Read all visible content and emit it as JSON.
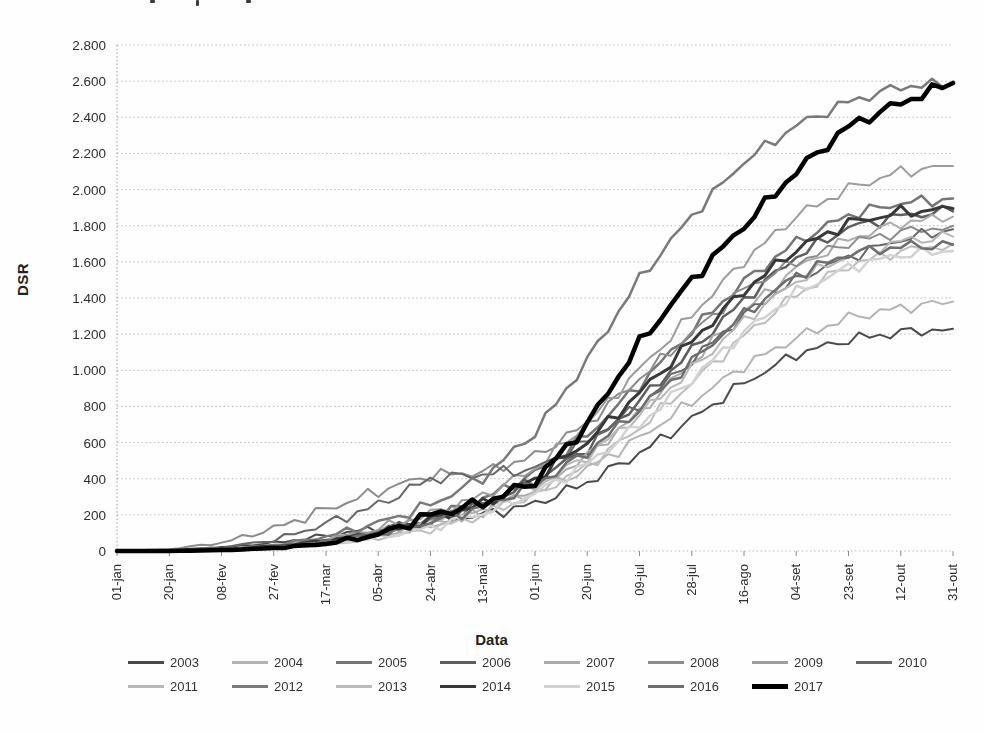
{
  "page": {
    "note": "scanned grayscale line chart, cropped text fragments at very top edge"
  },
  "chart_data": {
    "type": "line",
    "title": "",
    "xlabel": "Data",
    "ylabel": "DSR",
    "x": [
      "01-jan",
      "20-jan",
      "08-fev",
      "27-fev",
      "17-mar",
      "05-abr",
      "24-abr",
      "13-mai",
      "01-jun",
      "20-jun",
      "09-jul",
      "28-jul",
      "16-ago",
      "04-set",
      "23-set",
      "12-out",
      "31-out"
    ],
    "ylim": [
      0,
      2800
    ],
    "y_ticks": [
      0,
      200,
      400,
      600,
      800,
      1000,
      1200,
      1400,
      1600,
      1800,
      2000,
      2200,
      2400,
      2600,
      2800
    ],
    "y_tick_labels": [
      "0",
      "200",
      "400",
      "600",
      "800",
      "1.000",
      "1.200",
      "1.400",
      "1.600",
      "1.800",
      "2.000",
      "2.200",
      "2.400",
      "2.600",
      "2.800"
    ],
    "grid": "horizontal-dotted",
    "legend_position": "bottom-two-rows",
    "series": [
      {
        "name": "2003",
        "color": "#4a4a4a",
        "width": 2,
        "values": [
          0,
          5,
          20,
          45,
          85,
          125,
          165,
          200,
          260,
          380,
          540,
          730,
          930,
          1090,
          1170,
          1210,
          1230
        ]
      },
      {
        "name": "2004",
        "color": "#b3b3b3",
        "width": 2,
        "values": [
          0,
          0,
          10,
          30,
          70,
          110,
          155,
          225,
          325,
          455,
          625,
          825,
          1025,
          1180,
          1290,
          1345,
          1380
        ]
      },
      {
        "name": "2005",
        "color": "#757575",
        "width": 2.5,
        "values": [
          0,
          0,
          5,
          20,
          50,
          100,
          180,
          285,
          430,
          640,
          920,
          1220,
          1490,
          1710,
          1860,
          1925,
          1950
        ]
      },
      {
        "name": "2006",
        "color": "#5e5e5e",
        "width": 2.5,
        "values": [
          0,
          0,
          10,
          30,
          60,
          110,
          175,
          255,
          385,
          570,
          830,
          1110,
          1390,
          1630,
          1790,
          1855,
          1880
        ]
      },
      {
        "name": "2007",
        "color": "#ababab",
        "width": 2,
        "values": [
          0,
          0,
          5,
          15,
          40,
          80,
          140,
          225,
          345,
          525,
          765,
          1045,
          1325,
          1565,
          1725,
          1815,
          1850
        ]
      },
      {
        "name": "2008",
        "color": "#8c8c8c",
        "width": 2,
        "values": [
          0,
          10,
          45,
          125,
          230,
          330,
          420,
          435,
          525,
          705,
          955,
          1205,
          1450,
          1600,
          1705,
          1765,
          1800
        ]
      },
      {
        "name": "2009",
        "color": "#9c9c9c",
        "width": 2,
        "values": [
          0,
          0,
          10,
          25,
          60,
          125,
          205,
          305,
          455,
          705,
          1005,
          1305,
          1605,
          1855,
          2005,
          2100,
          2130
        ]
      },
      {
        "name": "2010",
        "color": "#676767",
        "width": 2,
        "values": [
          0,
          0,
          20,
          60,
          150,
          255,
          400,
          425,
          455,
          605,
          805,
          1055,
          1305,
          1505,
          1625,
          1725,
          1780
        ]
      },
      {
        "name": "2011",
        "color": "#b7b7b7",
        "width": 2,
        "values": [
          0,
          0,
          5,
          20,
          45,
          90,
          150,
          235,
          355,
          525,
          755,
          1005,
          1275,
          1495,
          1635,
          1715,
          1740
        ]
      },
      {
        "name": "2012",
        "color": "#7a7a7a",
        "width": 2.5,
        "values": [
          0,
          0,
          10,
          30,
          80,
          155,
          255,
          405,
          655,
          1055,
          1505,
          1855,
          2155,
          2355,
          2485,
          2570,
          2585
        ]
      },
      {
        "name": "2013",
        "color": "#bcbcbc",
        "width": 2,
        "values": [
          0,
          0,
          5,
          15,
          35,
          70,
          120,
          200,
          310,
          470,
          680,
          930,
          1190,
          1420,
          1580,
          1660,
          1700
        ]
      },
      {
        "name": "2014",
        "color": "#383838",
        "width": 3,
        "values": [
          0,
          0,
          10,
          25,
          55,
          100,
          170,
          260,
          400,
          605,
          875,
          1160,
          1440,
          1670,
          1815,
          1875,
          1895
        ]
      },
      {
        "name": "2015",
        "color": "#d2d2d2",
        "width": 2.5,
        "values": [
          0,
          0,
          5,
          15,
          40,
          75,
          130,
          210,
          320,
          480,
          700,
          950,
          1210,
          1430,
          1570,
          1640,
          1660
        ]
      },
      {
        "name": "2016",
        "color": "#6e6e6e",
        "width": 2.5,
        "values": [
          0,
          0,
          10,
          20,
          50,
          95,
          160,
          245,
          365,
          545,
          785,
          1045,
          1310,
          1525,
          1645,
          1685,
          1695
        ]
      },
      {
        "name": "2017",
        "color": "#000000",
        "width": 4.5,
        "values": [
          0,
          0,
          5,
          15,
          40,
          90,
          200,
          265,
          385,
          700,
          1150,
          1500,
          1800,
          2100,
          2350,
          2480,
          2590
        ]
      }
    ],
    "legend_rows": [
      8,
      7
    ]
  }
}
